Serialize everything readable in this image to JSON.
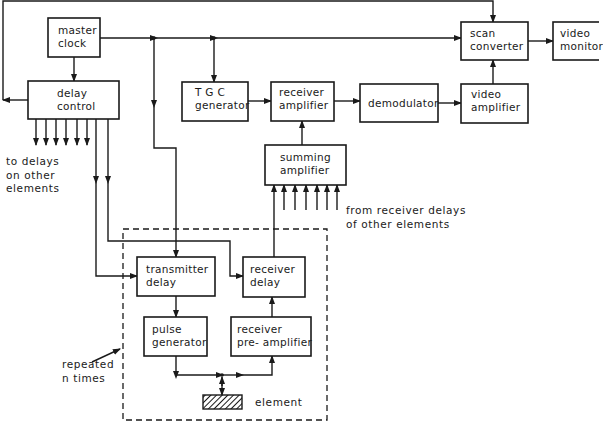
{
  "blocks": {
    "master_clock": "master\nclock",
    "delay_control": "delay\ncontrol",
    "tgc_generator": "T G C\ngenerator",
    "receiver_amplifier": "receiver\namplifier",
    "demodulator": "demodulator",
    "video_amplifier": "video\namplifier",
    "scan_converter": "scan\nconverter",
    "video_monitor": "video\nmonitor",
    "summing_amplifier": "summing\namplifier",
    "transmitter_delay": "transmitter\ndelay",
    "receiver_delay": "receiver\ndelay",
    "pulse_generator": "pulse\ngenerator",
    "receiver_preamplifier": "receiver\npre- amplifier"
  },
  "notes": {
    "to_delays": "to delays\non other\nelements",
    "from_receiver_delays": "from receiver delays\nof other elements",
    "repeated": "repeated\nn times",
    "element": "element"
  },
  "colors": {
    "line": "#1a1a1a",
    "background": "#ffffff"
  }
}
